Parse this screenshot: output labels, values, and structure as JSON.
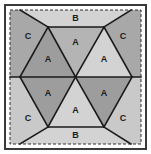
{
  "figure": {
    "name": "hexagon-triangle-tessellation",
    "canvas": {
      "width": 151,
      "height": 154
    },
    "colors": {
      "background": "#ffffff",
      "outer_border": "#3a3a3a",
      "dashed_border": "#2e2e2e",
      "edge_line": "#1a1a1a",
      "label_text": "#1c1c1c",
      "shade_dark": "#9d9d9d",
      "shade_medium": "#b4b4b4",
      "shade_light": "#d3d3d3",
      "shade_corner_dark": "#a8a8a8",
      "shade_corner_light": "#c9c9c9"
    },
    "frame": {
      "outer_rect": {
        "x": 5,
        "y": 5,
        "width": 141,
        "height": 144
      },
      "dashed_rect": {
        "x": 10,
        "y": 10,
        "width": 131,
        "height": 134
      },
      "outer_stroke_width": 2,
      "dashed_stroke_width": 1,
      "dash_pattern": "3,2"
    },
    "geometry": {
      "center": {
        "x": 75.5,
        "y": 77
      },
      "hexagon_points": "48,27 104,27 132,77 104,127 48,127 20,77",
      "left_edge_x": 10,
      "right_edge_x": 141,
      "top_edge_y": 10,
      "bottom_edge_y": 144,
      "midline_y": 77
    },
    "regions": [
      {
        "id": "tri-top-left",
        "label": "A",
        "shade": "shade_dark",
        "points": "48,27 75.5,77 20,77",
        "label_x": 48,
        "label_y": 60
      },
      {
        "id": "tri-top-center",
        "label": "A",
        "shade": "shade_medium",
        "points": "48,27 104,27 75.5,77",
        "label_x": 75.5,
        "label_y": 43
      },
      {
        "id": "tri-top-right",
        "label": "A",
        "shade": "shade_light",
        "points": "104,27 132,77 75.5,77",
        "label_x": 104,
        "label_y": 60
      },
      {
        "id": "tri-bottom-left",
        "label": "A",
        "shade": "shade_dark",
        "points": "20,77 75.5,77 48,127",
        "label_x": 48,
        "label_y": 94
      },
      {
        "id": "tri-bottom-center",
        "label": "A",
        "shade": "shade_light",
        "points": "48,127 104,127 75.5,77",
        "label_x": 75.5,
        "label_y": 111
      },
      {
        "id": "tri-bottom-right",
        "label": "A",
        "shade": "shade_dark",
        "points": "75.5,77 132,77 104,127",
        "label_x": 104,
        "label_y": 94
      },
      {
        "id": "trap-top",
        "label": "B",
        "shade": "shade_light",
        "points": "20,10 131,10 104,27 48,27",
        "label_x": 75.5,
        "label_y": 19
      },
      {
        "id": "trap-bottom",
        "label": "B",
        "shade": "shade_light",
        "points": "48,127 104,127 131,144 20,144",
        "label_x": 75.5,
        "label_y": 136
      },
      {
        "id": "corner-top-left",
        "label": "C",
        "shade": "shade_corner_dark",
        "points": "10,10 20,10 48,27 20,77 10,77",
        "label_x": 28,
        "label_y": 37
      },
      {
        "id": "corner-top-right",
        "label": "C",
        "shade": "shade_corner_dark",
        "points": "131,10 141,10 141,77 132,77 104,27",
        "label_x": 123,
        "label_y": 37
      },
      {
        "id": "corner-bottom-left",
        "label": "C",
        "shade": "shade_corner_light",
        "points": "10,77 20,77 48,127 20,144 10,144",
        "label_x": 28,
        "label_y": 119
      },
      {
        "id": "corner-bottom-right",
        "label": "C",
        "shade": "shade_corner_light",
        "points": "141,77 141,144 131,144 104,127 132,77",
        "label_x": 123,
        "label_y": 119
      }
    ],
    "edges": [
      {
        "id": "edge-midline",
        "x1": 10,
        "y1": 77,
        "x2": 141,
        "y2": 77
      },
      {
        "id": "edge-hex-top",
        "x1": 48,
        "y1": 27,
        "x2": 104,
        "y2": 27
      },
      {
        "id": "edge-hex-bottom",
        "x1": 48,
        "y1": 127,
        "x2": 104,
        "y2": 127
      },
      {
        "id": "edge-hex-upper-left",
        "x1": 20,
        "y1": 77,
        "x2": 48,
        "y2": 27
      },
      {
        "id": "edge-hex-upper-right",
        "x1": 104,
        "y1": 27,
        "x2": 132,
        "y2": 77
      },
      {
        "id": "edge-hex-lower-left",
        "x1": 20,
        "y1": 77,
        "x2": 48,
        "y2": 127
      },
      {
        "id": "edge-hex-lower-right",
        "x1": 104,
        "y1": 127,
        "x2": 132,
        "y2": 77
      },
      {
        "id": "edge-spoke-upper-left",
        "x1": 48,
        "y1": 27,
        "x2": 75.5,
        "y2": 77
      },
      {
        "id": "edge-spoke-upper-right",
        "x1": 104,
        "y1": 27,
        "x2": 75.5,
        "y2": 77
      },
      {
        "id": "edge-spoke-lower-left",
        "x1": 48,
        "y1": 127,
        "x2": 75.5,
        "y2": 77
      },
      {
        "id": "edge-spoke-lower-right",
        "x1": 104,
        "y1": 127,
        "x2": 75.5,
        "y2": 77
      },
      {
        "id": "edge-corner-tl-diag",
        "x1": 20,
        "y1": 10,
        "x2": 48,
        "y2": 27
      },
      {
        "id": "edge-corner-tr-diag",
        "x1": 131,
        "y1": 10,
        "x2": 104,
        "y2": 27
      },
      {
        "id": "edge-corner-bl-diag",
        "x1": 20,
        "y1": 144,
        "x2": 48,
        "y2": 127
      },
      {
        "id": "edge-corner-br-diag",
        "x1": 131,
        "y1": 144,
        "x2": 104,
        "y2": 127
      }
    ],
    "legend": {
      "piece_a": "A",
      "piece_b": "B",
      "piece_c": "C"
    }
  }
}
